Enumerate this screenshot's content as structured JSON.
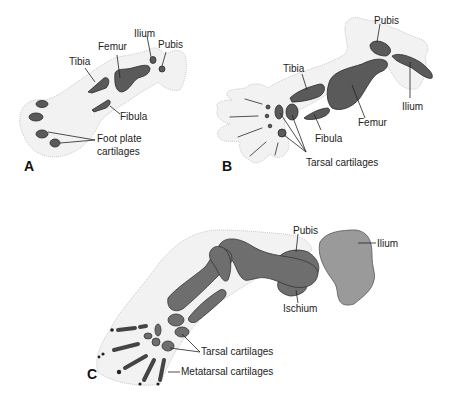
{
  "figure": {
    "panels": [
      {
        "id": "A",
        "letter": "A",
        "labels": {
          "ilium": "Ilium",
          "pubis": "Pubis",
          "femur": "Femur",
          "tibia": "Tibia",
          "fibula": "Fibula",
          "foot_plate_1": "Foot plate",
          "foot_plate_2": "cartilages"
        }
      },
      {
        "id": "B",
        "letter": "B",
        "labels": {
          "pubis": "Pubis",
          "tibia": "Tibia",
          "ilium": "Ilium",
          "femur": "Femur",
          "fibula": "Fibula",
          "tarsal": "Tarsal cartilages"
        }
      },
      {
        "id": "C",
        "letter": "C",
        "labels": {
          "pubis": "Pubis",
          "ilium": "Ilium",
          "ischium": "Ischium",
          "tarsal": "Tarsal cartilages",
          "metatarsal": "Metatarsal cartilages"
        }
      }
    ]
  },
  "colors": {
    "skin": "#f2f2f2",
    "cartilage": "#5a5a5a",
    "bone": "#6e6e6e",
    "ilium_c": "#9a9a9a",
    "text": "#222222"
  }
}
